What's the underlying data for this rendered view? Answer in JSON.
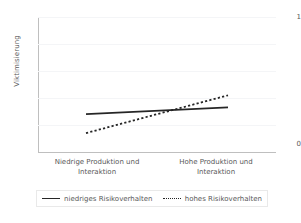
{
  "chart_data": {
    "type": "line",
    "title": "",
    "subtitle": "",
    "xlabel": "",
    "ylabel": "Viktimisierung",
    "categories": [
      "Niedrige Produktion und Interaktion",
      "Hohe Produktion und Interaktion"
    ],
    "x": [
      0,
      1
    ],
    "ylim": [
      0,
      1
    ],
    "yticks": [
      0,
      1
    ],
    "ytick_labels": [
      "0",
      "1"
    ],
    "grid": true,
    "gridlines_y": [
      0.2,
      0.4,
      0.6,
      0.8,
      1.0
    ],
    "legend_position": "bottom",
    "series": [
      {
        "name": "niedriges Risikoverhalten",
        "style": "solid",
        "color": "#262626",
        "values": [
          0.28,
          0.33
        ]
      },
      {
        "name": "hohes Risikoverhalten",
        "style": "dotted",
        "color": "#262626",
        "values": [
          0.14,
          0.42
        ]
      }
    ]
  },
  "axes": {
    "y_title": "Viktimisierung",
    "y_tick_top": "1",
    "y_tick_bottom": "0",
    "x_categories": [
      {
        "line1": "Niedrige Produktion und",
        "line2": "Interaktion"
      },
      {
        "line1": "Hohe Produktion und",
        "line2": "Interaktion"
      }
    ]
  },
  "legend": {
    "entries": [
      {
        "label": "niedriges Risikoverhalten",
        "style": "solid"
      },
      {
        "label": "hohes Risikoverhalten",
        "style": "dotted"
      }
    ]
  },
  "colors": {
    "series_line": "#262626",
    "axis": "#bfbfbf",
    "gridline": "#f4f5f7",
    "text": "#595959",
    "background": "#ffffff"
  }
}
